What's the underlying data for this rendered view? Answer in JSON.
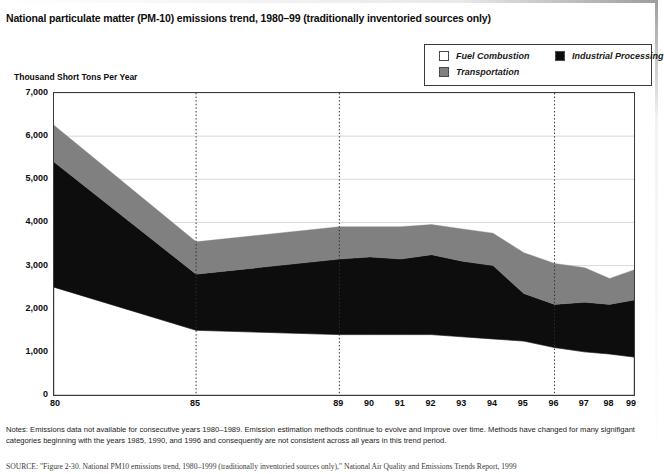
{
  "title": "National particulate matter (PM-10) emissions trend, 1980–99 (traditionally inventoried sources only)",
  "legend": {
    "items": [
      {
        "label": "Fuel Combustion",
        "color": "#ffffff",
        "swatch_name": "legend-swatch-fuel-combustion"
      },
      {
        "label": "Transportation",
        "color": "#808080",
        "swatch_name": "legend-swatch-transportation"
      },
      {
        "label": "Industrial Processing",
        "color": "#0d0d0d",
        "swatch_name": "legend-swatch-industrial-processing"
      }
    ]
  },
  "notes": {
    "prefix": "Notes:",
    "text": "Emissions data not available for consecutive years 1980–1989.  Emission estimation methods continue to evolve and improve over time.  Methods have changed for many signifigant categories beginning with the years 1985, 1990, and 1996 and consequently are not consistent across all years in this trend period."
  },
  "source": {
    "text": "SOURCE: \"Figure 2-30. National PM10 emissions trend, 1980–1999 (traditionally inventoried sources only),\" National Air Quality and Emissions Trends Report, 1999"
  },
  "chart_data": {
    "type": "area",
    "stacked": true,
    "title": "National particulate matter (PM-10) emissions trend, 1980–99 (traditionally inventoried sources only)",
    "xlabel": "",
    "ylabel": "Thousand Short Tons Per Year",
    "ylim": [
      0,
      7000
    ],
    "ytick_labels": [
      "7,000",
      "6,000",
      "5,000",
      "4,000",
      "3,000",
      "2,000",
      "1,000",
      "0"
    ],
    "ytick_values": [
      7000,
      6000,
      5000,
      4000,
      3000,
      2000,
      1000,
      0
    ],
    "grid": "horizontal-solid-light; vertical-dotted at 85, 89, 96",
    "vertical_gridline_years": [
      "85",
      "89",
      "96"
    ],
    "legend_position": "top-right, outside plot",
    "x": [
      "80",
      "85",
      "89",
      "90",
      "91",
      "92",
      "93",
      "94",
      "95",
      "96",
      "97",
      "98",
      "99"
    ],
    "x_positions_fraction": [
      0.0,
      0.245,
      0.492,
      0.545,
      0.598,
      0.651,
      0.704,
      0.757,
      0.81,
      0.863,
      0.915,
      0.958,
      1.0
    ],
    "series": [
      {
        "name": "Fuel Combustion",
        "color": "#ffffff",
        "stack_order": 1,
        "values": [
          2500,
          1500,
          1400,
          1400,
          1400,
          1400,
          1350,
          1300,
          1250,
          1100,
          1000,
          950,
          880
        ]
      },
      {
        "name": "Industrial Processing",
        "color": "#0d0d0d",
        "stack_order": 2,
        "values": [
          2900,
          1300,
          1750,
          1800,
          1750,
          1850,
          1750,
          1700,
          1100,
          1000,
          1150,
          1150,
          1320
        ]
      },
      {
        "name": "Transportation",
        "color": "#808080",
        "stack_order": 3,
        "values": [
          850,
          750,
          750,
          700,
          750,
          700,
          750,
          750,
          950,
          950,
          800,
          600,
          700
        ]
      }
    ],
    "cumulative_totals": [
      6250,
      3550,
      3900,
      3900,
      3900,
      3950,
      3850,
      3750,
      3300,
      3050,
      2950,
      2700,
      2900
    ]
  }
}
